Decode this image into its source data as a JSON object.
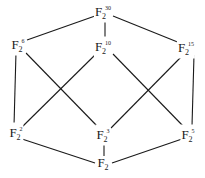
{
  "diagram": {
    "nodes": [
      {
        "id": "n30",
        "base": "F",
        "sub": "2",
        "exp": "30",
        "x": 103,
        "y": 12
      },
      {
        "id": "n6",
        "base": "F",
        "sub": "2",
        "exp": "6",
        "x": 18,
        "y": 45
      },
      {
        "id": "n10",
        "base": "F",
        "sub": "2",
        "exp": "10",
        "x": 103,
        "y": 47
      },
      {
        "id": "n15",
        "base": "F",
        "sub": "2",
        "exp": "15",
        "x": 186,
        "y": 48
      },
      {
        "id": "n2",
        "base": "F",
        "sub": "2",
        "exp": "2",
        "x": 16,
        "y": 133
      },
      {
        "id": "n3",
        "base": "F",
        "sub": "2",
        "exp": "3",
        "x": 103,
        "y": 135
      },
      {
        "id": "n5",
        "base": "F",
        "sub": "2",
        "exp": "5",
        "x": 188,
        "y": 135
      },
      {
        "id": "n1",
        "base": "F",
        "sub": "2",
        "exp": "",
        "x": 103,
        "y": 165
      }
    ],
    "edges": [
      [
        "n30",
        "n6"
      ],
      [
        "n30",
        "n10"
      ],
      [
        "n30",
        "n15"
      ],
      [
        "n6",
        "n2"
      ],
      [
        "n6",
        "n3"
      ],
      [
        "n10",
        "n2"
      ],
      [
        "n10",
        "n5"
      ],
      [
        "n15",
        "n3"
      ],
      [
        "n15",
        "n5"
      ],
      [
        "n2",
        "n1"
      ],
      [
        "n3",
        "n1"
      ],
      [
        "n5",
        "n1"
      ]
    ],
    "line_color": "#1a1a1a"
  }
}
